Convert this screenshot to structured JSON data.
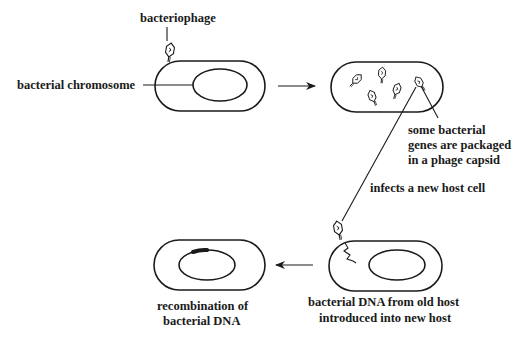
{
  "diagram": {
    "labels": {
      "bacteriophage": "bacteriophage",
      "bacterial_chromosome": "bacterial chromosome",
      "packaged_line1": "some bacterial",
      "packaged_line2": "genes are packaged",
      "packaged_line3": "in a phage capsid",
      "infects": "infects a new host cell",
      "introduced_line1": "bacterial DNA from old host",
      "introduced_line2": "introduced into new host",
      "recombination_line1": "recombination of",
      "recombination_line2": "bacterial DNA"
    },
    "stages": [
      {
        "id": "infection",
        "description": "bacteriophage attached to bacterium containing bacterial chromosome"
      },
      {
        "id": "packaging",
        "description": "cell filled with new phages; some bacterial genes are packaged in a phage capsid"
      },
      {
        "id": "new-host",
        "description": "phage injects bacterial DNA from old host into new host"
      },
      {
        "id": "recombination",
        "description": "recombination of bacterial DNA into host chromosome"
      }
    ],
    "arrows": [
      {
        "from": "infection",
        "to": "packaging",
        "direction": "right"
      },
      {
        "from": "packaging",
        "to": "new-host",
        "label": "infects a new host cell"
      },
      {
        "from": "new-host",
        "to": "recombination",
        "direction": "left"
      }
    ],
    "colors": {
      "ink": "#1a1a1a",
      "background": "#ffffff"
    }
  }
}
